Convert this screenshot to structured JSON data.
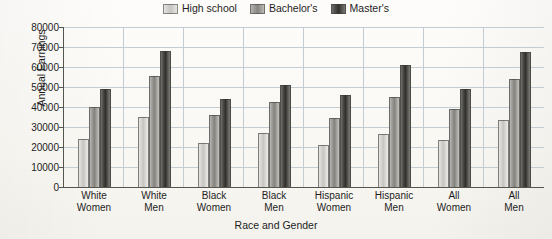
{
  "chart_data": {
    "type": "bar",
    "title": "",
    "xlabel": "Race and Gender",
    "ylabel": "Annual Earnings",
    "ylim": [
      0,
      80000
    ],
    "ytick_step": 10000,
    "yticks": [
      "80000",
      "70000",
      "60000",
      "50000",
      "40000",
      "30000",
      "20000",
      "10000",
      "0"
    ],
    "grid": "horizontal",
    "legend_position": "top-center",
    "categories": [
      "White Women",
      "White Men",
      "Black Women",
      "Black Men",
      "Hispanic Women",
      "Hispanic Men",
      "All Women",
      "All Men"
    ],
    "categories_lines": [
      [
        "White",
        "Women"
      ],
      [
        "White",
        "Men"
      ],
      [
        "Black",
        "Women"
      ],
      [
        "Black",
        "Men"
      ],
      [
        "Hispanic",
        "Women"
      ],
      [
        "Hispanic",
        "Men"
      ],
      [
        "All",
        "Women"
      ],
      [
        "All",
        "Men"
      ]
    ],
    "series": [
      {
        "name": "High school",
        "color": "#d2d1cd",
        "values": [
          24000,
          35000,
          22000,
          27000,
          21000,
          26500,
          23500,
          33500
        ]
      },
      {
        "name": "Bachelor's",
        "color": "#8d8c87",
        "values": [
          40000,
          55500,
          36000,
          42500,
          34500,
          45000,
          39000,
          54000
        ]
      },
      {
        "name": "Master's",
        "color": "#3a3936",
        "values": [
          49000,
          68000,
          44000,
          51000,
          46000,
          61000,
          49000,
          67500
        ]
      }
    ]
  },
  "legend": {
    "items": [
      {
        "label": "High school"
      },
      {
        "label": "Bachelor's"
      },
      {
        "label": "Master's"
      }
    ]
  }
}
